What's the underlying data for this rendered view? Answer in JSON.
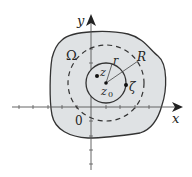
{
  "diagram": {
    "colors": {
      "region_fill": "#dfe2e4",
      "stroke": "#333333",
      "axis": "#555555"
    },
    "labels": {
      "x_axis": "x",
      "y_axis": "y",
      "origin": "0",
      "region": "Ω",
      "center": "z",
      "center_sub": "0",
      "point_z": "z",
      "point_zeta": "ζ",
      "radius_small": "r",
      "radius_large": "R"
    },
    "elements": [
      {
        "name": "region",
        "description": "Shaded domain Omega"
      },
      {
        "name": "small-circle",
        "description": "Solid circle of radius r centered at z0"
      },
      {
        "name": "large-circle",
        "description": "Dashed circle of radius R centered at z0"
      },
      {
        "name": "point-z",
        "description": "Point z inside small circle"
      },
      {
        "name": "point-zeta",
        "description": "Point zeta on small circle"
      },
      {
        "name": "point-z0",
        "description": "Center z0"
      }
    ]
  }
}
